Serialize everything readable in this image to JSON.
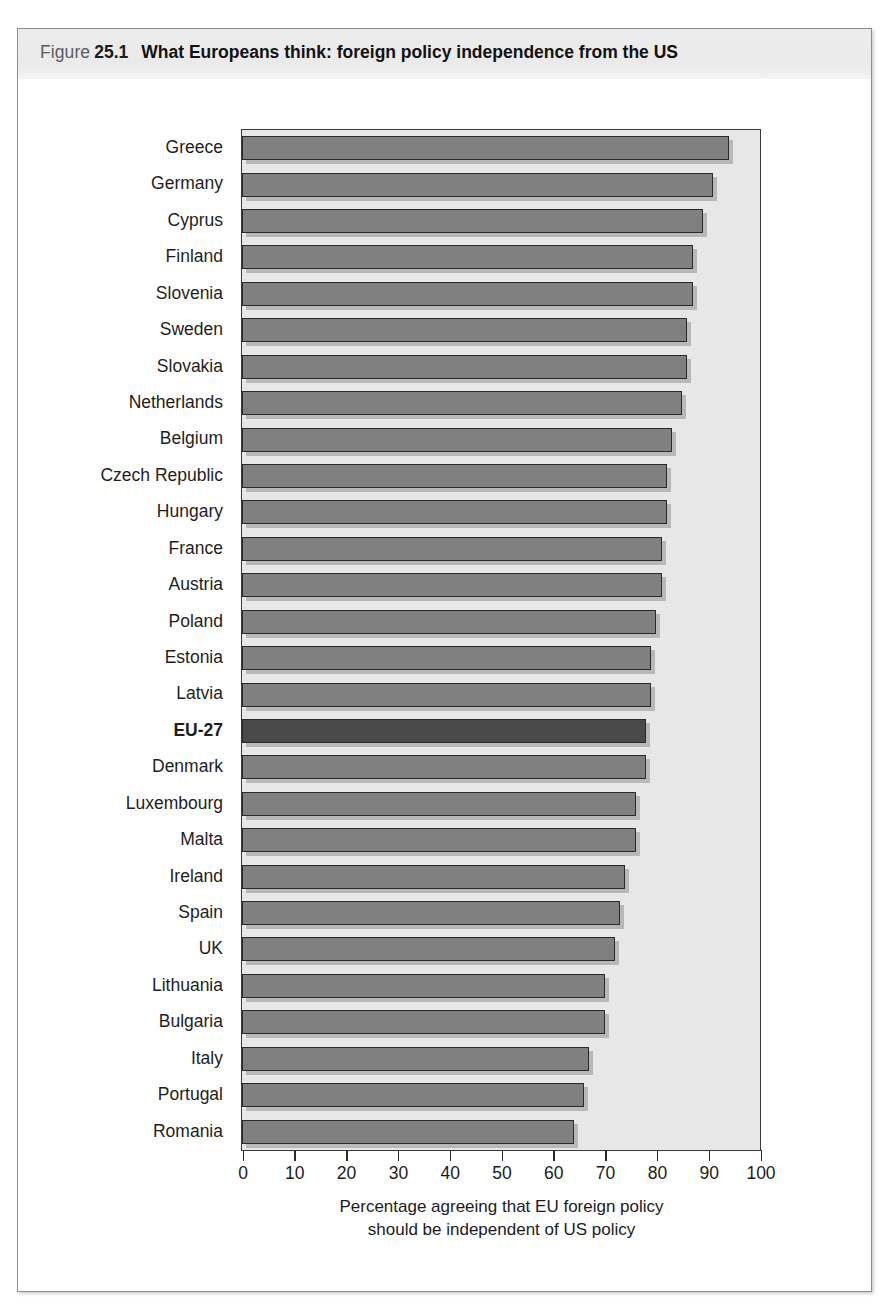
{
  "figure": {
    "label": "Figure",
    "number": "25.1",
    "title": "What Europeans think: foreign policy independence from the US"
  },
  "chart_data": {
    "type": "bar",
    "orientation": "horizontal",
    "title": "What Europeans think: foreign policy independence from the US",
    "xlabel_line1": "Percentage agreeing that EU foreign policy",
    "xlabel_line2": "should be independent of US policy",
    "ylabel": "",
    "xlim": [
      0,
      100
    ],
    "xticks": [
      0,
      10,
      20,
      30,
      40,
      50,
      60,
      70,
      80,
      90,
      100
    ],
    "grid": false,
    "legend": "none",
    "highlight_category": "EU-27",
    "colors": {
      "bar": "#808080",
      "bar_highlight": "#4a4a4a",
      "bar_edge": "#2a2a2a",
      "plot_background": "#e7e7e7",
      "header_band": "#eaeaea",
      "text": "#1b1b1b"
    },
    "categories": [
      "Greece",
      "Germany",
      "Cyprus",
      "Finland",
      "Slovenia",
      "Sweden",
      "Slovakia",
      "Netherlands",
      "Belgium",
      "Czech Republic",
      "Hungary",
      "France",
      "Austria",
      "Poland",
      "Estonia",
      "Latvia",
      "EU-27",
      "Denmark",
      "Luxembourg",
      "Malta",
      "Ireland",
      "Spain",
      "UK",
      "Lithuania",
      "Bulgaria",
      "Italy",
      "Portugal",
      "Romania"
    ],
    "values": [
      94,
      91,
      89,
      87,
      87,
      86,
      86,
      85,
      83,
      82,
      82,
      81,
      81,
      80,
      79,
      79,
      78,
      78,
      76,
      76,
      74,
      73,
      72,
      70,
      70,
      67,
      66,
      64
    ]
  }
}
